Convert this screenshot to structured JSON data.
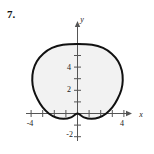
{
  "figure": {
    "problem_number": "7.",
    "axis_labels": {
      "x": "x",
      "y": "y"
    }
  },
  "chart_data": {
    "type": "line",
    "title": "",
    "subtitle": "",
    "xlabel": "x",
    "ylabel": "y",
    "grid": false,
    "legend": null,
    "xlim": [
      -4.8,
      4.8
    ],
    "ylim": [
      -2.8,
      6.8
    ],
    "x_ticks": [
      -4,
      -3,
      -2,
      -1,
      1,
      2,
      3,
      4
    ],
    "x_tick_labels": {
      "-4": "-4",
      "4": "4"
    },
    "y_ticks": [
      -2,
      -1,
      1,
      2,
      3,
      4,
      5,
      6
    ],
    "y_tick_labels": {
      "4": "4",
      "2": "2",
      "-2": "-2"
    },
    "curve": {
      "name": "cardioid",
      "equation": "r = 3(1 - sin(theta))",
      "closed": true,
      "filled": true,
      "fill_color": "#f2f2f2",
      "stroke_color": "#111111",
      "stroke_width": 2,
      "cusp_point": [
        0,
        0
      ],
      "top_point": [
        0,
        6
      ],
      "left_extreme": [
        -3.9,
        2.6
      ],
      "right_extreme": [
        3.9,
        2.6
      ],
      "lobe_minimum_y": -0.45,
      "points": [
        [
          0,
          0
        ],
        [
          -0.55,
          -0.33
        ],
        [
          -1.2,
          -0.46
        ],
        [
          -1.85,
          -0.35
        ],
        [
          -2.45,
          -0.02
        ],
        [
          -3.0,
          0.52
        ],
        [
          -3.45,
          1.25
        ],
        [
          -3.78,
          2.05
        ],
        [
          -3.9,
          2.85
        ],
        [
          -3.82,
          3.7
        ],
        [
          -3.5,
          4.5
        ],
        [
          -2.95,
          5.15
        ],
        [
          -2.2,
          5.65
        ],
        [
          -1.25,
          5.93
        ],
        [
          0,
          6.0
        ],
        [
          1.25,
          5.93
        ],
        [
          2.2,
          5.65
        ],
        [
          2.95,
          5.15
        ],
        [
          3.5,
          4.5
        ],
        [
          3.82,
          3.7
        ],
        [
          3.9,
          2.85
        ],
        [
          3.78,
          2.05
        ],
        [
          3.45,
          1.25
        ],
        [
          3.0,
          0.52
        ],
        [
          2.45,
          -0.02
        ],
        [
          1.85,
          -0.35
        ],
        [
          1.2,
          -0.46
        ],
        [
          0.55,
          -0.33
        ],
        [
          0,
          0
        ]
      ]
    },
    "colors": {
      "axis": "#555555",
      "curve": "#111111",
      "fill": "#f2f2f2",
      "text": "#1a1a1a"
    }
  }
}
